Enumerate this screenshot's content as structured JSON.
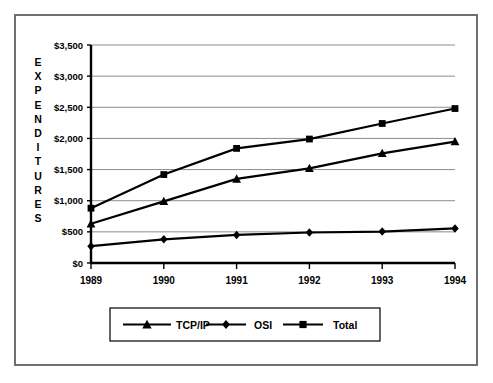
{
  "chart_data": {
    "type": "line",
    "title": "",
    "xlabel": "",
    "ylabel": "EXPENDITURES",
    "categories": [
      "1989",
      "1990",
      "1991",
      "1992",
      "1993",
      "1994"
    ],
    "ylim": [
      0,
      3500
    ],
    "ytick_values": [
      0,
      500,
      1000,
      1500,
      2000,
      2500,
      3000,
      3500
    ],
    "ytick_labels": [
      "$0",
      "$500",
      "$1,000",
      "$1,500",
      "$2,000",
      "$2,500",
      "$3,000",
      "$3,500"
    ],
    "grid": true,
    "legend_position": "bottom",
    "series": [
      {
        "name": "TCP/IP",
        "marker": "triangle",
        "color": "#000000",
        "values": [
          630,
          990,
          1350,
          1520,
          1760,
          1950
        ]
      },
      {
        "name": "OSI",
        "marker": "diamond",
        "color": "#000000",
        "values": [
          270,
          380,
          450,
          490,
          505,
          555
        ]
      },
      {
        "name": "Total",
        "marker": "square",
        "color": "#000000",
        "values": [
          880,
          1420,
          1840,
          1990,
          2240,
          2480
        ]
      }
    ]
  },
  "legend": {
    "entries": [
      {
        "label": "TCP/IP",
        "marker": "triangle"
      },
      {
        "label": "OSI",
        "marker": "diamond"
      },
      {
        "label": "Total",
        "marker": "square"
      }
    ]
  },
  "axis": {
    "y_title_letters": [
      "E",
      "X",
      "P",
      "E",
      "N",
      "D",
      "I",
      "T",
      "U",
      "R",
      "E",
      "S"
    ]
  },
  "colors": {
    "line": "#000000",
    "grid": "#8c8c8c",
    "axis": "#000000",
    "border": "#6f6f6f",
    "background": "#ffffff"
  }
}
